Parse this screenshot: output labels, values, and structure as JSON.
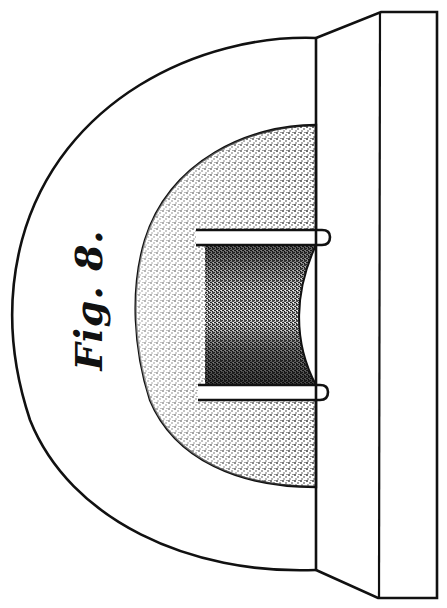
{
  "figure": {
    "label": "Fig. 8.",
    "label_orientation": "rotated -90deg",
    "colors": {
      "ink": "#111111",
      "paper": "#ffffff",
      "stipple_light": "#bdbdbd",
      "stipple_dark": "#2a2a2a"
    },
    "parts": [
      {
        "name": "outer-half-disc",
        "shape": "semicircular arc"
      },
      {
        "name": "stippled-inner-half-disc",
        "shading": "stipple"
      },
      {
        "name": "upper-rod",
        "shape": "horizontal bar with rounded end"
      },
      {
        "name": "lower-rod",
        "shape": "horizontal bar with rounded end"
      },
      {
        "name": "concave-recess",
        "shading": "dark stipple"
      },
      {
        "name": "right-mounting-plate",
        "shape": "trapezoidal flange with rectangular plate"
      }
    ]
  }
}
